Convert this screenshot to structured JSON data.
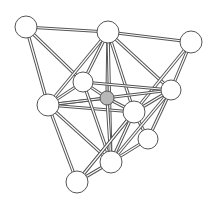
{
  "diagram": {
    "type": "ball-and-stick cluster",
    "colors": {
      "bond": "#555555",
      "atom_fill": "#ffffff",
      "center_fill": "#b8b8b8",
      "background": "#ffffff"
    },
    "nodes": [
      {
        "id": "A",
        "x": 26,
        "y": 27,
        "r": 11,
        "kind": "vertex"
      },
      {
        "id": "B",
        "x": 108,
        "y": 32,
        "r": 11,
        "kind": "vertex"
      },
      {
        "id": "C",
        "x": 191,
        "y": 42,
        "r": 11,
        "kind": "vertex"
      },
      {
        "id": "D",
        "x": 83,
        "y": 82,
        "r": 10,
        "kind": "vertex"
      },
      {
        "id": "E",
        "x": 107,
        "y": 98,
        "r": 7,
        "kind": "center"
      },
      {
        "id": "G",
        "x": 48,
        "y": 105,
        "r": 11,
        "kind": "vertex"
      },
      {
        "id": "I",
        "x": 171,
        "y": 90,
        "r": 10,
        "kind": "vertex"
      },
      {
        "id": "F",
        "x": 134,
        "y": 112,
        "r": 11,
        "kind": "vertex"
      },
      {
        "id": "J",
        "x": 148,
        "y": 139,
        "r": 10,
        "kind": "vertex"
      },
      {
        "id": "K",
        "x": 111,
        "y": 162,
        "r": 11,
        "kind": "vertex"
      },
      {
        "id": "H",
        "x": 77,
        "y": 182,
        "r": 11,
        "kind": "vertex"
      }
    ],
    "edges": [
      [
        "A",
        "B"
      ],
      [
        "B",
        "C"
      ],
      [
        "A",
        "G"
      ],
      [
        "A",
        "D"
      ],
      [
        "B",
        "D"
      ],
      [
        "B",
        "G"
      ],
      [
        "B",
        "E"
      ],
      [
        "B",
        "F"
      ],
      [
        "B",
        "I"
      ],
      [
        "B",
        "K"
      ],
      [
        "C",
        "I"
      ],
      [
        "C",
        "H"
      ],
      [
        "G",
        "D"
      ],
      [
        "G",
        "E"
      ],
      [
        "G",
        "F"
      ],
      [
        "G",
        "I"
      ],
      [
        "G",
        "K"
      ],
      [
        "G",
        "H"
      ],
      [
        "D",
        "E"
      ],
      [
        "D",
        "I"
      ],
      [
        "D",
        "K"
      ],
      [
        "E",
        "F"
      ],
      [
        "E",
        "K"
      ],
      [
        "F",
        "I"
      ],
      [
        "F",
        "J"
      ],
      [
        "F",
        "K"
      ],
      [
        "F",
        "H"
      ],
      [
        "I",
        "J"
      ],
      [
        "I",
        "K"
      ],
      [
        "J",
        "K"
      ],
      [
        "H",
        "K"
      ]
    ]
  }
}
